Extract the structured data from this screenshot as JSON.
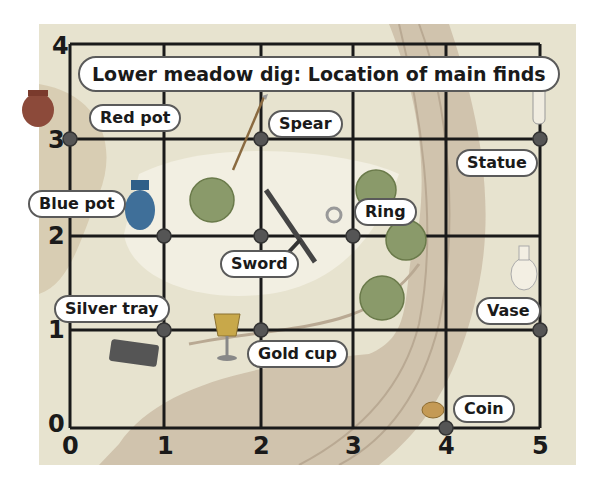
{
  "title": "Lower meadow dig: Location of main finds",
  "axes": {
    "x_ticks": [
      "0",
      "1",
      "2",
      "3",
      "4",
      "5"
    ],
    "y_ticks": [
      "0",
      "1",
      "2",
      "3",
      "4"
    ]
  },
  "finds": [
    {
      "label": "Red pot",
      "x": 0,
      "y": 3,
      "icon": "red-pot-icon"
    },
    {
      "label": "Spear",
      "x": 2,
      "y": 3,
      "icon": "spear-icon"
    },
    {
      "label": "Statue",
      "x": 5,
      "y": 3,
      "icon": "statue-icon"
    },
    {
      "label": "Blue pot",
      "x": 1,
      "y": 2,
      "icon": "blue-pot-icon"
    },
    {
      "label": "Sword",
      "x": 2,
      "y": 2,
      "icon": "sword-icon"
    },
    {
      "label": "Ring",
      "x": 3,
      "y": 2,
      "icon": "ring-icon"
    },
    {
      "label": "Silver tray",
      "x": 1,
      "y": 1,
      "icon": "silver-tray-icon"
    },
    {
      "label": "Gold cup",
      "x": 2,
      "y": 1,
      "icon": "gold-cup-icon"
    },
    {
      "label": "Vase",
      "x": 5,
      "y": 1,
      "icon": "vase-icon"
    },
    {
      "label": "Coin",
      "x": 4,
      "y": 0,
      "icon": "coin-icon"
    }
  ],
  "colors": {
    "grid": "#1a1a1a",
    "point": "#4a4a4a",
    "meadow": "#dcd9c4",
    "river": "#c9b9a4",
    "bush": "#c07a5a"
  }
}
